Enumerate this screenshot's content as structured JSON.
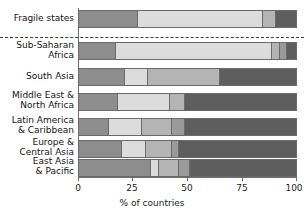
{
  "chart_data": {
    "type": "bar",
    "orientation": "horizontal",
    "stacked": true,
    "title": "",
    "subtitle": "",
    "xlabel": "% of countries",
    "ylabel": "",
    "xlim": [
      0,
      100
    ],
    "grid": false,
    "legend": null,
    "legend_position": "none",
    "tick_labels": [
      "0",
      "25",
      "50",
      "75",
      "100"
    ],
    "ticks": [
      0,
      25,
      50,
      75,
      100
    ],
    "categories": [
      "Fragile states",
      "Sub-Saharan Africa",
      "South Asia",
      "Middle East & North Africa",
      "Latin America & Caribbean",
      "Europe & Central Asia",
      "East Asia & Pacific"
    ],
    "series": [
      {
        "name": "segment-1",
        "color": "#8d8d8d",
        "values": [
          27,
          17,
          21,
          18,
          14,
          20,
          33
        ]
      },
      {
        "name": "segment-2",
        "color": "#dcdcdc",
        "values": [
          57,
          71,
          11,
          24,
          15,
          11,
          4
        ]
      },
      {
        "name": "segment-3",
        "color": "#b4b4b4",
        "values": [
          6,
          4,
          33,
          7,
          14,
          12,
          9
        ]
      },
      {
        "name": "segment-4",
        "color": "#9a9a9a",
        "values": [
          0,
          3,
          0,
          0,
          6,
          3,
          5
        ]
      },
      {
        "name": "segment-5",
        "color": "#5e5e5e",
        "values": [
          9,
          4,
          35,
          51,
          51,
          54,
          49
        ]
      }
    ],
    "annotations": [
      {
        "type": "dashed-separator",
        "after_category": "Fragile states"
      }
    ]
  },
  "axis": {
    "x_label": "% of countries",
    "tick_0": "0",
    "tick_25": "25",
    "tick_50": "50",
    "tick_75": "75",
    "tick_100": "100"
  },
  "rows": [
    {
      "line1": "Fragile states",
      "line2": ""
    },
    {
      "line1": "Sub-Saharan",
      "line2": "Africa"
    },
    {
      "line1": "South Asia",
      "line2": ""
    },
    {
      "line1": "Middle East &",
      "line2": "North Africa"
    },
    {
      "line1": "Latin America",
      "line2": "& Caribbean"
    },
    {
      "line1": "Europe &",
      "line2": "Central Asia"
    },
    {
      "line1": "East Asia",
      "line2": "& Pacific"
    }
  ]
}
